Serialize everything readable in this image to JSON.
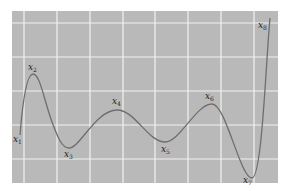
{
  "figure": {
    "background_color": "#b9b9b9",
    "grid_color": "#f2f2f2",
    "curve_color": "#6e6e6e",
    "panel": {
      "x": 12,
      "y": 11,
      "width": 266,
      "height": 172
    },
    "grid_x": [
      24,
      57,
      90,
      123,
      155,
      188,
      221,
      254
    ],
    "grid_y": [
      23,
      57,
      91,
      125,
      159
    ]
  },
  "points": [
    {
      "name": "x",
      "sub": "1",
      "label_x": 13,
      "label_y": 142,
      "curve_x": 20,
      "curve_y": 135
    },
    {
      "name": "x",
      "sub": "2",
      "label_x": 28,
      "label_y": 70,
      "curve_x": 33,
      "curve_y": 74
    },
    {
      "name": "x",
      "sub": "3",
      "label_x": 64,
      "label_y": 157,
      "curve_x": 69,
      "curve_y": 148
    },
    {
      "name": "x",
      "sub": "4",
      "label_x": 112,
      "label_y": 104,
      "curve_x": 117,
      "curve_y": 110
    },
    {
      "name": "x",
      "sub": "5",
      "label_x": 161,
      "label_y": 152,
      "curve_x": 165,
      "curve_y": 142
    },
    {
      "name": "x",
      "sub": "6",
      "label_x": 205,
      "label_y": 99,
      "curve_x": 212,
      "curve_y": 104
    },
    {
      "name": "x",
      "sub": "7",
      "label_x": 243,
      "label_y": 183,
      "curve_x": 252,
      "curve_y": 178
    },
    {
      "name": "x",
      "sub": "8",
      "label_x": 258,
      "label_y": 28,
      "curve_x": 270,
      "curve_y": 18
    }
  ]
}
